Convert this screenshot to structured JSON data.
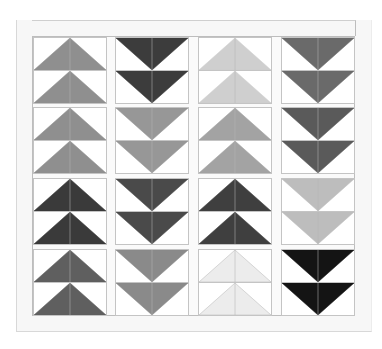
{
  "quilt": {
    "columns": 4,
    "blocks_per_column": 4,
    "units_per_block": 2,
    "columns_data": [
      {
        "name": "column-1",
        "direction": "up",
        "block_colors": [
          "#8f8f8f",
          "#8f8f8f",
          "#3a3a3a",
          "#5f5f5f"
        ]
      },
      {
        "name": "column-2",
        "direction": "down",
        "block_colors": [
          "#3c3c3c",
          "#979797",
          "#4a4a4a",
          "#8a8a8a"
        ]
      },
      {
        "name": "column-3",
        "direction": "up",
        "block_colors": [
          "#cfcfcf",
          "#a3a3a3",
          "#3f3f3f",
          "#ececec"
        ]
      },
      {
        "name": "column-4",
        "direction": "down",
        "block_colors": [
          "#6a6a6a",
          "#5a5a5a",
          "#bdbdbd",
          "#141414"
        ]
      }
    ],
    "background_color": "#ffffff",
    "border_color": "#f7f7f7",
    "seam_color": "#b5b5b5"
  }
}
